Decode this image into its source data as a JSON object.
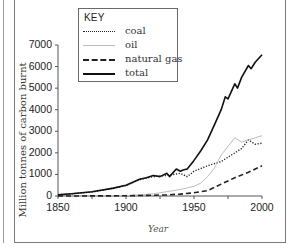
{
  "chart_data": {
    "type": "line",
    "title": "",
    "xlabel": "Year",
    "ylabel": "Million tonnes of carbon burnt",
    "xlim": [
      1850,
      2000
    ],
    "ylim": [
      0,
      7000
    ],
    "xticks": [
      1850,
      1900,
      1950,
      2000
    ],
    "yticks": [
      0,
      1000,
      2000,
      3000,
      4000,
      5000,
      6000,
      7000
    ],
    "grid": false,
    "legend_position": "top-left (inside plot)",
    "legend_title": "KEY",
    "series": [
      {
        "name": "coal",
        "style": "dotted",
        "x": [
          1850,
          1875,
          1900,
          1910,
          1920,
          1930,
          1940,
          1945,
          1950,
          1960,
          1970,
          1980,
          1985,
          1990,
          1995,
          2000
        ],
        "values": [
          50,
          180,
          480,
          760,
          900,
          950,
          1050,
          900,
          1150,
          1400,
          1600,
          2000,
          2200,
          2600,
          2400,
          2450
        ]
      },
      {
        "name": "oil",
        "style": "thin-solid-gray",
        "x": [
          1850,
          1900,
          1920,
          1930,
          1940,
          1950,
          1955,
          1960,
          1965,
          1970,
          1975,
          1980,
          1985,
          1990,
          1995,
          2000
        ],
        "values": [
          0,
          20,
          100,
          200,
          300,
          450,
          600,
          900,
          1300,
          1900,
          2300,
          2700,
          2500,
          2600,
          2700,
          2800
        ]
      },
      {
        "name": "natural gas",
        "style": "dashed",
        "x": [
          1850,
          1900,
          1930,
          1940,
          1950,
          1960,
          1970,
          1980,
          1990,
          2000
        ],
        "values": [
          0,
          10,
          50,
          90,
          150,
          250,
          550,
          850,
          1100,
          1400
        ]
      },
      {
        "name": "total",
        "style": "solid-thick",
        "x": [
          1850,
          1860,
          1875,
          1890,
          1900,
          1910,
          1915,
          1920,
          1925,
          1930,
          1932,
          1937,
          1940,
          1942,
          1945,
          1950,
          1955,
          1960,
          1965,
          1970,
          1973,
          1975,
          1980,
          1982,
          1985,
          1990,
          1992,
          1995,
          2000
        ],
        "values": [
          50,
          100,
          200,
          350,
          500,
          780,
          850,
          950,
          900,
          1050,
          900,
          1250,
          1150,
          1200,
          1250,
          1650,
          2100,
          2600,
          3300,
          4000,
          4600,
          4500,
          5200,
          5000,
          5500,
          6050,
          5900,
          6200,
          6550
        ]
      }
    ]
  },
  "legend": {
    "title": "KEY",
    "items": [
      {
        "label": "coal"
      },
      {
        "label": "oil"
      },
      {
        "label": "natural gas"
      },
      {
        "label": "total"
      }
    ]
  },
  "axes": {
    "ylabel": "Million tonnes of carbon burnt",
    "xlabel": "Year",
    "yticks": [
      "0",
      "1000",
      "2000",
      "3000",
      "4000",
      "5000",
      "6000",
      "7000"
    ],
    "xticks": [
      "1850",
      "1900",
      "1950",
      "2000"
    ]
  },
  "colors": {
    "total": "#111111",
    "coal": "#222222",
    "oil": "#bdbdbd",
    "natural_gas": "#222222",
    "axis": "#555555"
  }
}
